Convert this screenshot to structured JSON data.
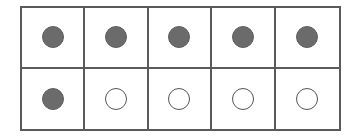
{
  "ten_frame": {
    "rows": 2,
    "columns": 5,
    "filled_count": 6,
    "empty_count": 4,
    "total_cells": 10,
    "colors": {
      "filled": "#6b6b6b",
      "empty": "#ffffff",
      "border": "#5a5a5a"
    },
    "cells": [
      {
        "row": 1,
        "col": 1,
        "state": "filled"
      },
      {
        "row": 1,
        "col": 2,
        "state": "filled"
      },
      {
        "row": 1,
        "col": 3,
        "state": "filled"
      },
      {
        "row": 1,
        "col": 4,
        "state": "filled"
      },
      {
        "row": 1,
        "col": 5,
        "state": "filled"
      },
      {
        "row": 2,
        "col": 1,
        "state": "filled"
      },
      {
        "row": 2,
        "col": 2,
        "state": "empty"
      },
      {
        "row": 2,
        "col": 3,
        "state": "empty"
      },
      {
        "row": 2,
        "col": 4,
        "state": "empty"
      },
      {
        "row": 2,
        "col": 5,
        "state": "empty"
      }
    ]
  }
}
